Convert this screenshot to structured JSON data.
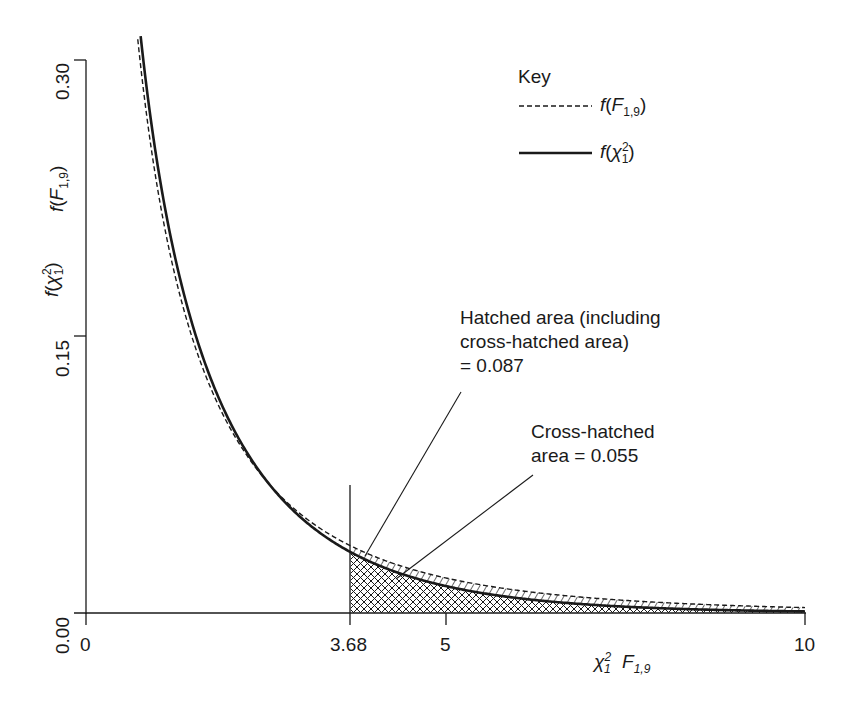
{
  "chart_data": {
    "type": "line",
    "title": "",
    "xlabel": "χ²₁  F₁,₉",
    "ylabel": "f(χ²₁)  f(F₁,₉)",
    "xlim": [
      0,
      10
    ],
    "ylim": [
      0,
      0.3
    ],
    "grid": false,
    "legend_position": "upper right",
    "x_ticks": [
      0,
      3.68,
      5,
      10
    ],
    "x_tick_labels": [
      "0",
      "3.68",
      "5",
      "10"
    ],
    "y_ticks": [
      0.0,
      0.15,
      0.3
    ],
    "y_tick_labels": [
      "0.00",
      "0.15",
      "0.30"
    ],
    "series": [
      {
        "name": "f(F1,9)",
        "style": "dashed",
        "distribution": "F",
        "df1": 1,
        "df2": 9,
        "x": [
          0.75,
          1,
          1.5,
          2,
          2.5,
          3,
          3.68,
          4,
          5,
          6,
          7,
          8,
          9,
          10
        ],
        "values": [
          0.291,
          0.23,
          0.153,
          0.108,
          0.079,
          0.059,
          0.04,
          0.034,
          0.021,
          0.014,
          0.009,
          0.006,
          0.004,
          0.003
        ]
      },
      {
        "name": "f(χ²1)",
        "style": "solid",
        "distribution": "chi-square",
        "df": 1,
        "x": [
          0.75,
          1,
          1.5,
          2,
          2.5,
          3,
          3.68,
          4,
          5,
          6,
          7,
          8,
          9,
          10
        ],
        "values": [
          0.316,
          0.242,
          0.154,
          0.104,
          0.073,
          0.051,
          0.033,
          0.027,
          0.015,
          0.008,
          0.004,
          0.002,
          0.001,
          0.001
        ]
      }
    ],
    "critical_value": 3.68,
    "annotations": [
      {
        "text": "Hatched area (including cross-hatched area) = 0.087",
        "refers_to": "upper tail of F(1,9) beyond 3.68",
        "value": 0.087
      },
      {
        "text": "Cross-hatched area = 0.055",
        "refers_to": "upper tail of χ²(1) beyond 3.68",
        "value": 0.055
      }
    ]
  },
  "legend": {
    "title": "Key",
    "dashed_label_f": "f",
    "dashed_label_var": "F",
    "dashed_label_sub": "1,9",
    "solid_label_f": "f",
    "solid_label_var": "χ",
    "solid_label_sup": "2",
    "solid_label_sub": "1"
  },
  "axes": {
    "y_ticks": [
      "0.30",
      "0.15",
      "0.00"
    ],
    "x_ticks": [
      "0",
      "3.68",
      "5",
      "10"
    ],
    "y_label_chi": {
      "f": "f",
      "var": "χ",
      "sup": "2",
      "sub": "1"
    },
    "y_label_F": {
      "f": "f",
      "var": "F",
      "sub": "1,9"
    },
    "x_label_chi": {
      "var": "χ",
      "sup": "2",
      "sub": "1"
    },
    "x_label_F": {
      "var": "F",
      "sub": "1,9"
    }
  },
  "annotations": {
    "hatched_line1": "Hatched area (including",
    "hatched_line2": "cross-hatched area)",
    "hatched_line3": "= 0.087",
    "cross_line1": "Cross-hatched",
    "cross_line2": "area = 0.055"
  },
  "colors": {
    "ink": "#1a1a1a",
    "background": "#ffffff"
  }
}
